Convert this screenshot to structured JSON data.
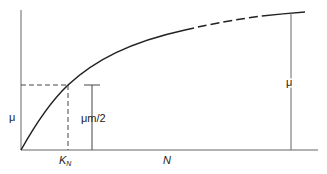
{
  "diagram": {
    "type": "saturation-curve",
    "labels": {
      "y_axis": "μ",
      "half_max": "μm/2",
      "right_mu": "μ",
      "x_axis": "N",
      "k_n_main": "K",
      "k_n_sub": "N"
    },
    "colors": {
      "line": "#222222",
      "axis": "#555555",
      "background": "#ffffff"
    }
  }
}
